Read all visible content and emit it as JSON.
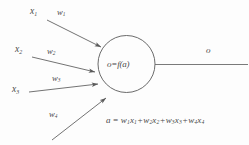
{
  "figure": {
    "stroke_color": "#5a5a5a",
    "text_color": "#4a4a4a",
    "background_color": "#fdfdfd"
  },
  "inputs": [
    {
      "var": "x",
      "var_sub": "1",
      "weight": "w",
      "weight_sub": "1"
    },
    {
      "var": "x",
      "var_sub": "2",
      "weight": "w",
      "weight_sub": "2"
    },
    {
      "var": "x",
      "var_sub": "3",
      "weight": "w",
      "weight_sub": "3"
    },
    {
      "var": "x",
      "var_sub": "4",
      "weight": "w",
      "weight_sub": "4"
    }
  ],
  "node": {
    "label": "o=f(a)",
    "shape": "circle"
  },
  "output": {
    "label": "o"
  },
  "equation": {
    "lhs": "a",
    "equals": "=",
    "rhs": "w₁x₁+w₂x₂+w₃x₃+w₄x₄",
    "full": "a = w1x1+w2x2+w3x3+w4x4",
    "terms": [
      {
        "weight": "w",
        "weight_sub": "1",
        "var": "x",
        "var_sub": "1"
      },
      {
        "weight": "w",
        "weight_sub": "2",
        "var": "x",
        "var_sub": "2"
      },
      {
        "weight": "w",
        "weight_sub": "3",
        "var": "x",
        "var_sub": "3"
      },
      {
        "weight": "w",
        "weight_sub": "4",
        "var": "x",
        "var_sub": "4"
      }
    ]
  }
}
